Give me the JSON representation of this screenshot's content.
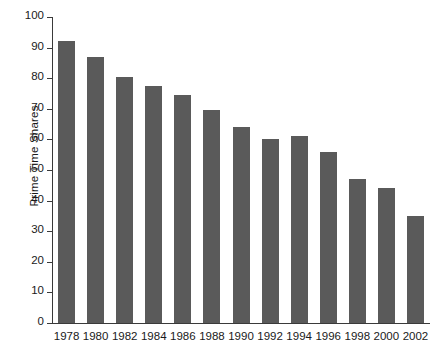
{
  "chart_data": {
    "type": "bar",
    "title": "",
    "xlabel": "",
    "ylabel": "Prime Time Shares",
    "categories": [
      "1978",
      "1980",
      "1982",
      "1984",
      "1986",
      "1988",
      "1990",
      "1992",
      "1994",
      "1996",
      "1998",
      "2000",
      "2002"
    ],
    "values": [
      92,
      87,
      80.5,
      77.5,
      74.5,
      69.5,
      64,
      60,
      61,
      56,
      47,
      44,
      35
    ],
    "ylim": [
      0,
      100
    ],
    "ytick_labels": [
      "0",
      "10",
      "20",
      "30",
      "40",
      "50",
      "60",
      "70",
      "80",
      "90",
      "100"
    ],
    "ytick_values": [
      0,
      10,
      20,
      30,
      40,
      50,
      60,
      70,
      80,
      90,
      100
    ],
    "grid": false,
    "legend": "none",
    "bar_color": "#5a5a5a",
    "axis_color": "#3a3a3a"
  }
}
